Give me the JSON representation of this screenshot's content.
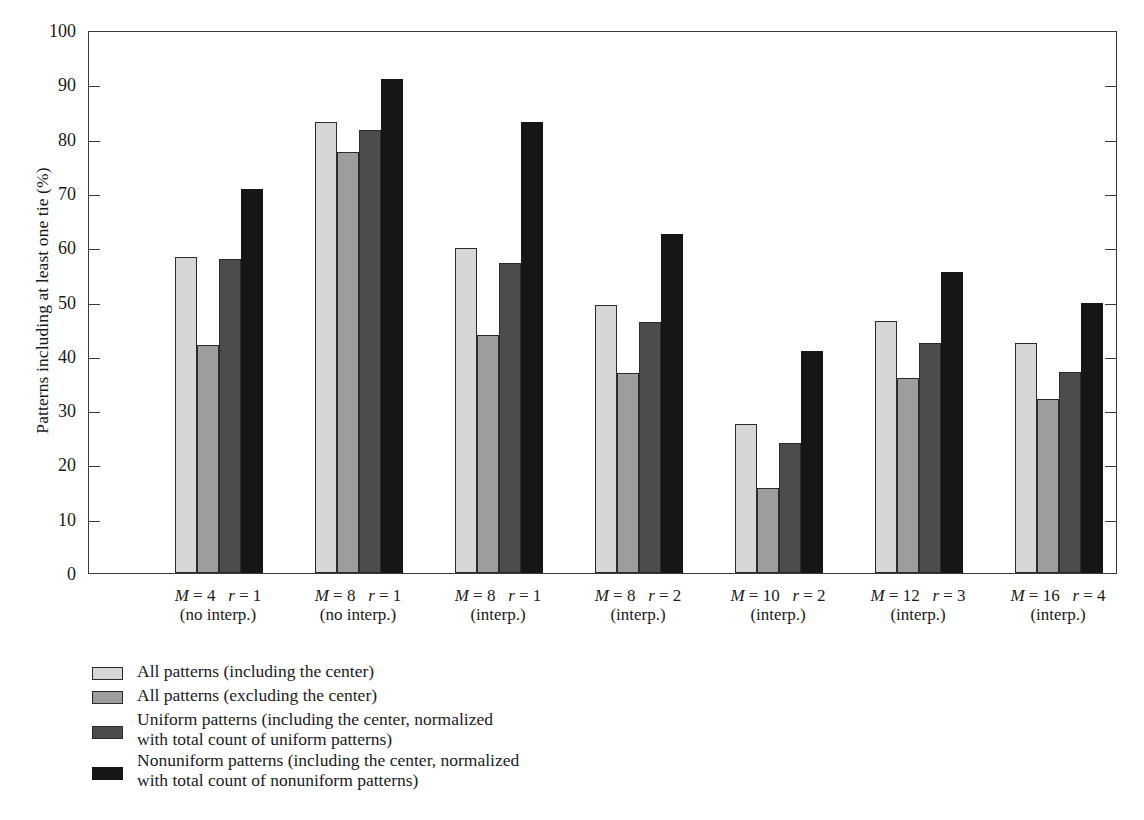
{
  "chart_data": {
    "type": "bar",
    "title": "",
    "xlabel": "",
    "ylabel": "Patterns including at least one tie (%)",
    "ylim": [
      0,
      100
    ],
    "yticks": [
      0,
      10,
      20,
      30,
      40,
      50,
      60,
      70,
      80,
      90,
      100
    ],
    "grid": false,
    "legend_position": "below-plot-left",
    "categories": [
      {
        "line1": "M = 4  r = 1",
        "line2": "(no interp.)",
        "M": 4,
        "r": 1,
        "interp": false
      },
      {
        "line1": "M = 8  r = 1",
        "line2": "(no interp.)",
        "M": 8,
        "r": 1,
        "interp": false
      },
      {
        "line1": "M = 8  r = 1",
        "line2": "(interp.)",
        "M": 8,
        "r": 1,
        "interp": true
      },
      {
        "line1": "M = 8  r = 2",
        "line2": "(interp.)",
        "M": 8,
        "r": 2,
        "interp": true
      },
      {
        "line1": "M = 10  r = 2",
        "line2": "(interp.)",
        "M": 10,
        "r": 2,
        "interp": true
      },
      {
        "line1": "M = 12  r = 3",
        "line2": "(interp.)",
        "M": 12,
        "r": 3,
        "interp": true
      },
      {
        "line1": "M = 16  r = 4",
        "line2": "(interp.)",
        "M": 16,
        "r": 4,
        "interp": true
      }
    ],
    "series": [
      {
        "name": "All patterns (including the center)",
        "color": "#d6d6d6",
        "values": [
          58.2,
          83.0,
          59.8,
          49.3,
          27.5,
          46.4,
          42.3
        ]
      },
      {
        "name": "All patterns (excluding the center)",
        "color": "#9d9d9d",
        "values": [
          41.9,
          77.5,
          43.9,
          36.8,
          15.6,
          36.0,
          32.0
        ]
      },
      {
        "name": "Uniform patterns (including the center, normalized\nwith total count of uniform patterns)",
        "color": "#4c4c4c",
        "values": [
          57.9,
          81.6,
          57.1,
          46.2,
          23.9,
          42.3,
          37.0
        ]
      },
      {
        "name": "Nonuniform patterns (including the center, normalized\nwith total count of nonuniform patterns)",
        "color": "#161616",
        "values": [
          70.8,
          91.0,
          83.1,
          62.5,
          40.9,
          55.4,
          49.7
        ]
      }
    ]
  },
  "legend": {
    "items": [
      {
        "label": "All patterns (including the center)",
        "color": "#d6d6d6",
        "lines": 1
      },
      {
        "label": "All patterns (excluding the center)",
        "color": "#9d9d9d",
        "lines": 1
      },
      {
        "label": "Uniform patterns (including the center, normalized\nwith total count of uniform patterns)",
        "color": "#4c4c4c",
        "lines": 2
      },
      {
        "label": "Nonuniform patterns (including the center, normalized\nwith total count of nonuniform patterns)",
        "color": "#161616",
        "lines": 2
      }
    ]
  }
}
